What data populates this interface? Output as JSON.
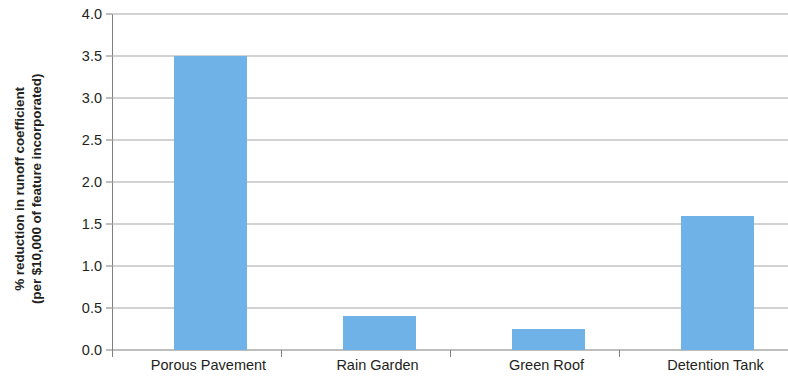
{
  "chart_data": {
    "type": "bar",
    "title": "",
    "subtitle": "",
    "xlabel": "",
    "ylabel": "% reduction in runoff coefficient (per $10,000 of feature incorporated)",
    "ylabel_line1": "% reduction in runoff coefficient",
    "ylabel_line2": "(per $10,000 of feature incorporated)",
    "categories": [
      "Porous Pavement",
      "Rain Garden",
      "Green Roof",
      "Detention Tank"
    ],
    "values": [
      3.5,
      0.4,
      0.25,
      1.6
    ],
    "ylim": [
      0.0,
      4.0
    ],
    "ytick_step": 0.5,
    "yticks": [
      "0.0",
      "0.5",
      "1.0",
      "1.5",
      "2.0",
      "2.5",
      "3.0",
      "3.5",
      "4.0"
    ],
    "ytick_values": [
      0.0,
      0.5,
      1.0,
      1.5,
      2.0,
      2.5,
      3.0,
      3.5,
      4.0
    ],
    "grid": true,
    "grid_axis": "y",
    "legend": false,
    "legend_position": "none",
    "bar_color": "#6fb2e8",
    "grid_color": "#a6a6a6",
    "axis_color": "#7f7f7f",
    "text_color": "#231f20",
    "background": "#ffffff"
  }
}
